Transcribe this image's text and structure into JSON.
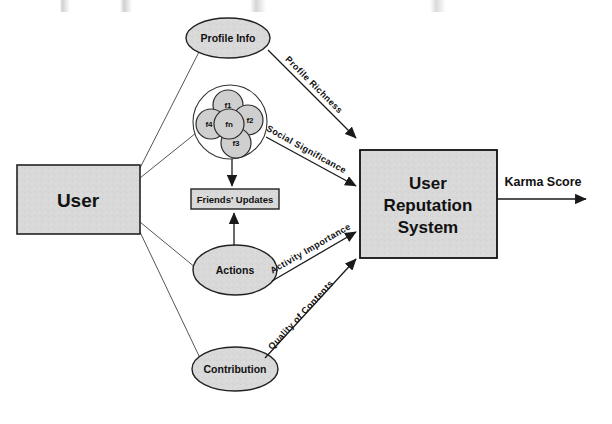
{
  "diagram": {
    "colors": {
      "node_fill": "#d9d9d9",
      "friend_fill": "#cfcfcf",
      "stroke": "#222222",
      "background": "#ffffff"
    },
    "nodes": {
      "user": {
        "label": "User",
        "shape": "rectangle"
      },
      "profile_info": {
        "label": "Profile Info",
        "shape": "ellipse"
      },
      "friends_updates": {
        "label": "Friends' Updates",
        "shape": "rectangle"
      },
      "actions": {
        "label": "Actions",
        "shape": "ellipse"
      },
      "contribution": {
        "label": "Contribution",
        "shape": "ellipse"
      },
      "reputation_system": {
        "line1": "User",
        "line2": "Reputation",
        "line3": "System",
        "shape": "rectangle"
      }
    },
    "friend_cluster": {
      "shape": "circle-group",
      "members": [
        {
          "id": "f1",
          "label": "f1"
        },
        {
          "id": "f2",
          "label": "f2"
        },
        {
          "id": "f3",
          "label": "f3"
        },
        {
          "id": "f4",
          "label": "f4"
        },
        {
          "id": "fn",
          "label": "fn"
        }
      ]
    },
    "edge_labels": {
      "profile_richness": "Profile Richness",
      "social_significance": "Social Significance",
      "activity_importance": "Activity Importance",
      "quality_of_contents": "Quality of Contents"
    },
    "output": {
      "label": "Karma Score"
    }
  }
}
